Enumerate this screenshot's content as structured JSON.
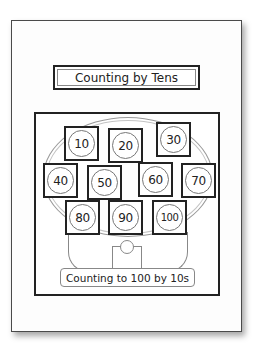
{
  "worksheet": {
    "title": "Counting by Tens",
    "caption": "Counting to 100 by 10s",
    "tiles": [
      {
        "value": "10"
      },
      {
        "value": "20"
      },
      {
        "value": "30"
      },
      {
        "value": "40"
      },
      {
        "value": "50"
      },
      {
        "value": "60"
      },
      {
        "value": "70"
      },
      {
        "value": "80"
      },
      {
        "value": "90"
      },
      {
        "value": "100"
      }
    ]
  }
}
